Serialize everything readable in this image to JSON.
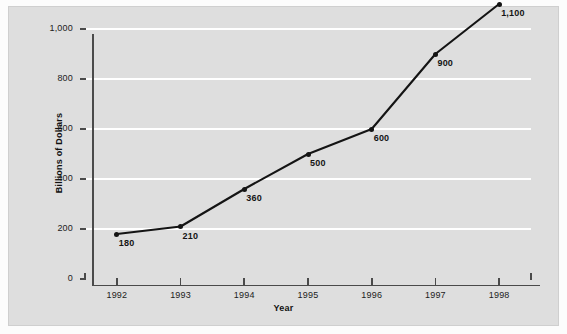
{
  "chart_data": {
    "type": "line",
    "title": "",
    "xlabel": "Year",
    "ylabel": "Billions of Dollars",
    "categories": [
      "1992",
      "1993",
      "1994",
      "1995",
      "1996",
      "1997",
      "1998"
    ],
    "values": [
      180,
      210,
      360,
      500,
      600,
      900,
      1100
    ],
    "point_labels": [
      "180",
      "210",
      "360",
      "500",
      "600",
      "900",
      "1,100"
    ],
    "ylim": [
      0,
      1000
    ],
    "yticks": [
      0,
      200,
      400,
      600,
      800,
      1000
    ],
    "ytick_labels": [
      "0",
      "200",
      "400",
      "600",
      "800",
      "1,000"
    ],
    "gridlines": "horizontal",
    "legend": "none",
    "series_color": "#141414",
    "panel_color": "#dedede",
    "gridline_color": "#ffffff",
    "axis_color": "#4a4a4a"
  },
  "axes": {
    "y_title": "Billions of Dollars",
    "x_title": "Year"
  }
}
